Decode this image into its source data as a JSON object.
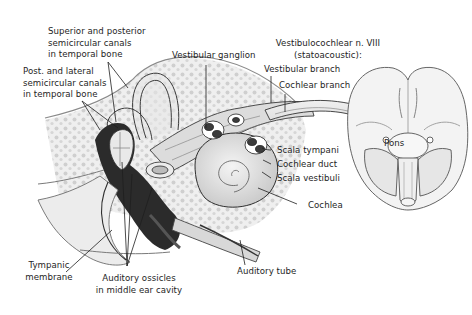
{
  "figure": {
    "type": "anatomical illustration"
  },
  "labels": {
    "sup_post_canals": {
      "line1": "Superior and posterior",
      "line2": "semicircular canals",
      "line3": "in temporal bone"
    },
    "post_lat_canals": {
      "line1": "Post. and lateral",
      "line2": "semicircular canals",
      "line3": "in temporal bone"
    },
    "vestibular_ganglion": "Vestibular ganglion",
    "vestibulocochlear_nerve": {
      "line1": "Vestibulocochlear n. VIII",
      "line2": "(statoacoustic):"
    },
    "vestibular_branch": "Vestibular branch",
    "cochlear_branch": "Cochlear branch",
    "pons": "Pons",
    "scala_tympani": "Scala tympani",
    "cochlear_duct": "Cochlear duct",
    "scala_vestibuli": "Scala vestibuli",
    "cochlea": "Cochlea",
    "tympanic_membrane": {
      "line1": "Tympanic",
      "line2": "membrane"
    },
    "auditory_ossicles": {
      "line1": "Auditory ossicles",
      "line2": "in middle ear cavity"
    },
    "auditory_tube": "Auditory tube"
  },
  "colors": {
    "background": "#ffffff",
    "line": "#2a2a2a",
    "bone_dots": "#c9c9c9",
    "tissue": "#e4e4e4",
    "dark_cavity": "#2b2b2b"
  }
}
